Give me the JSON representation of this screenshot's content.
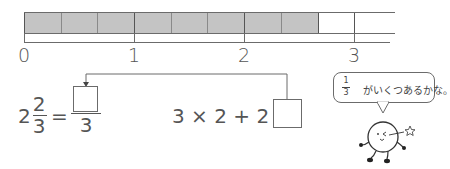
{
  "number_line": {
    "segments_total": 10,
    "segments_shaded": 8,
    "segment_fraction": "1/3",
    "tick_labels": [
      "0",
      "1",
      "2",
      "3"
    ]
  },
  "equation_left": {
    "whole": "2",
    "numerator": "2",
    "denominator": "3",
    "equals": "=",
    "answer_numerator_blank": "",
    "answer_denominator": "3"
  },
  "equation_right": {
    "expression": "3 × 2 + 2 =",
    "answer_blank": ""
  },
  "speech_bubble": {
    "fraction_numerator": "1",
    "fraction_denominator": "3",
    "text": "がいくつあるかな。"
  },
  "colors": {
    "shaded": "#c4c4c4",
    "line": "#6b6b6b",
    "text": "#555555"
  }
}
